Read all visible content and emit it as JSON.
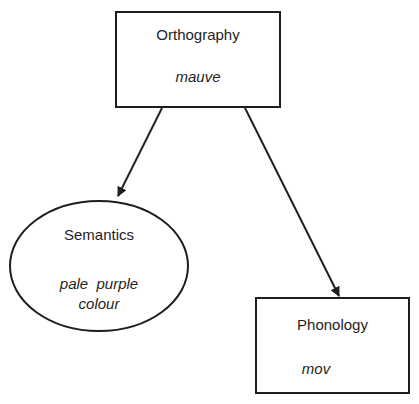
{
  "diagram": {
    "nodes": [
      {
        "id": "orthography",
        "shape": "rectangle",
        "title": "Orthography",
        "example": "mauve"
      },
      {
        "id": "semantics",
        "shape": "ellipse",
        "title": "Semantics",
        "example_line1": "pale  purple",
        "example_line2": "colour"
      },
      {
        "id": "phonology",
        "shape": "rectangle",
        "title": "Phonology",
        "example": "mov"
      }
    ],
    "edges": [
      {
        "from": "orthography",
        "to": "semantics",
        "directed": true
      },
      {
        "from": "orthography",
        "to": "phonology",
        "directed": true
      }
    ],
    "colors": {
      "stroke": "#1e1e1e",
      "background": "#ffffff"
    }
  }
}
